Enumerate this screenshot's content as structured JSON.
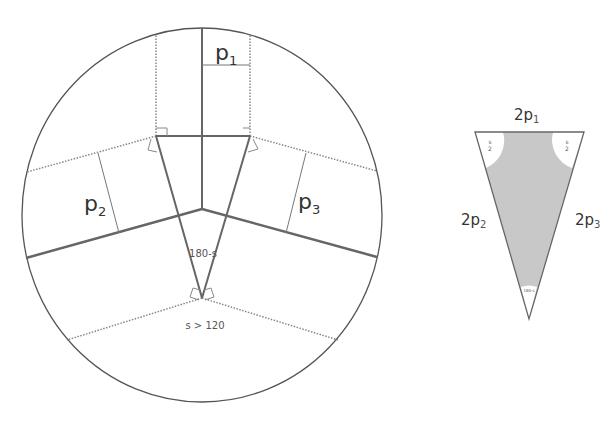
{
  "diagram": {
    "left_figure": {
      "labels": {
        "p1": {
          "base": "p",
          "sub": "1"
        },
        "p2": {
          "base": "p",
          "sub": "2"
        },
        "p3": {
          "base": "p",
          "sub": "3"
        },
        "angle_apex": "180-s",
        "condition": "s > 120"
      }
    },
    "right_figure": {
      "labels": {
        "top_side": {
          "base": "2p",
          "sub": "1"
        },
        "left_side": {
          "base": "2p",
          "sub": "2"
        },
        "right_side": {
          "base": "2p",
          "sub": "3"
        },
        "corner_left_num": "s",
        "corner_left_den": "2",
        "corner_right_num": "s",
        "corner_right_den": "2",
        "apex_angle": "180-s"
      },
      "fill_color": "#c8c8c8"
    },
    "colors": {
      "line": "#666666",
      "circle": "#555555",
      "dotted": "#888888"
    }
  }
}
